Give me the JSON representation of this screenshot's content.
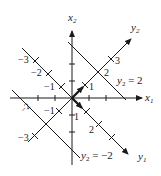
{
  "figure": {
    "colors": {
      "ink": "#1a1a1a",
      "background": "#ffffff"
    },
    "axes": {
      "x1": {
        "label": "x",
        "sub": "1"
      },
      "x2": {
        "label": "x",
        "sub": "2"
      },
      "y1": {
        "label": "y",
        "sub": "1"
      },
      "y2": {
        "label": "y",
        "sub": "2"
      }
    },
    "lines": {
      "y2_pos": {
        "label_var": "y",
        "label_sub": "2",
        "label_eq": " = 2"
      },
      "y2_neg": {
        "label_var": "y",
        "label_sub": "2",
        "label_eq": " = −2"
      }
    },
    "tick_labels": {
      "y1_neg3": "−3",
      "y1_neg2": "−2",
      "y1_neg1": "−1",
      "y1_pos1": "1",
      "y1_pos2": "2",
      "y2_pos1": "1",
      "y2_pos2": "2",
      "y2_pos3": "3",
      "y2_neg1": "−1",
      "y2_neg2": "−2",
      "y2_neg3": "−3"
    }
  }
}
